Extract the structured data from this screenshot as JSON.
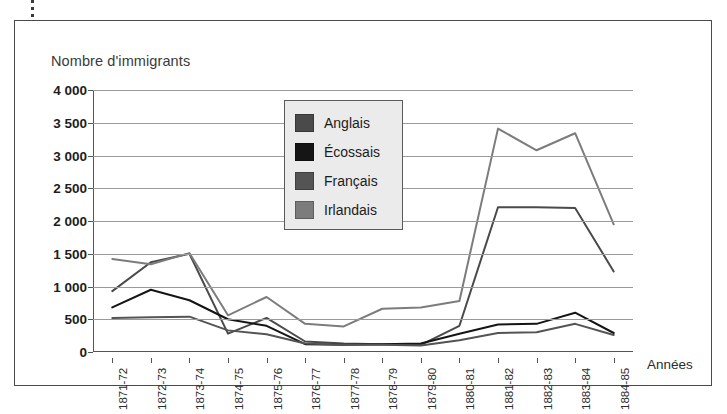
{
  "figure": {
    "axis_title_y": "Nombre d'immigrants",
    "axis_title_x": "Années"
  },
  "legend": {
    "items": [
      {
        "label": "Anglais",
        "color": "#4a4a4a"
      },
      {
        "label": "Écossais",
        "color": "#151515"
      },
      {
        "label": "Français",
        "color": "#545454"
      },
      {
        "label": "Irlandais",
        "color": "#7c7c7c"
      }
    ]
  },
  "axis": {
    "y_ticks": [
      "4 000",
      "3 500",
      "3 000",
      "2 500",
      "2 000",
      "1 500",
      "1 000",
      "500",
      "0"
    ],
    "x_ticks": [
      "1871-72",
      "1872-73",
      "1873-74",
      "1874-75",
      "1875-76",
      "1876-77",
      "1877-78",
      "1878-79",
      "1879-80",
      "1880-81",
      "1881-82",
      "1882-83",
      "1883-84",
      "1884-85"
    ]
  },
  "chart_data": {
    "type": "line",
    "title": "Nombre d'immigrants",
    "xlabel": "Années",
    "ylabel": "Nombre d'immigrants",
    "ylim": [
      0,
      4000
    ],
    "ytick_step": 500,
    "grid": true,
    "legend_position": "inside-top-center",
    "categories": [
      "1871-72",
      "1872-73",
      "1873-74",
      "1874-75",
      "1875-76",
      "1876-77",
      "1877-78",
      "1878-79",
      "1879-80",
      "1880-81",
      "1881-82",
      "1882-83",
      "1883-84",
      "1884-85"
    ],
    "series": [
      {
        "name": "Anglais",
        "color": "#4a4a4a",
        "values": [
          930,
          1370,
          1500,
          280,
          520,
          160,
          130,
          120,
          110,
          400,
          2210,
          2210,
          2200,
          1230
        ]
      },
      {
        "name": "Écossais",
        "color": "#151515",
        "values": [
          680,
          950,
          790,
          500,
          400,
          120,
          110,
          120,
          130,
          280,
          420,
          430,
          600,
          290
        ]
      },
      {
        "name": "Français",
        "color": "#545454",
        "values": [
          520,
          530,
          540,
          330,
          270,
          130,
          110,
          110,
          100,
          180,
          290,
          300,
          430,
          260
        ]
      },
      {
        "name": "Irlandais",
        "color": "#7c7c7c",
        "values": [
          1420,
          1340,
          1510,
          560,
          840,
          430,
          390,
          660,
          680,
          780,
          3410,
          3080,
          3340,
          1950
        ]
      }
    ]
  }
}
